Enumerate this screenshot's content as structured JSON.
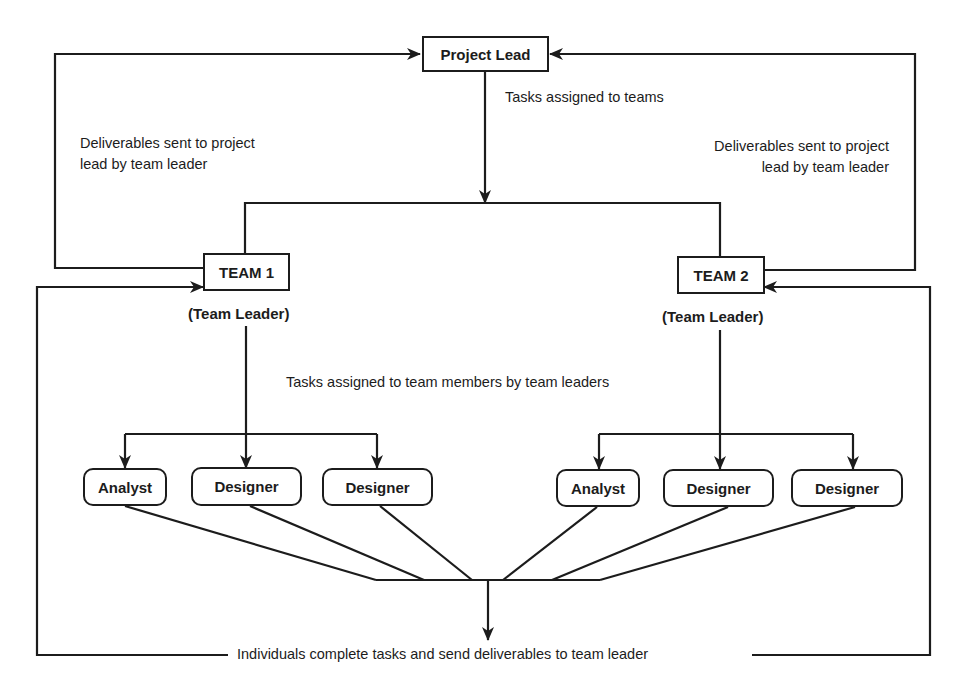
{
  "diagram": {
    "type": "team-hierarchy-flow",
    "line_color": "#1c1c1c",
    "nodes": {
      "project_lead": "Project Lead",
      "team1": "TEAM 1",
      "team1_role": "(Team Leader)",
      "team2": "TEAM 2",
      "team2_role": "(Team Leader)",
      "team1_members": [
        "Analyst",
        "Designer",
        "Designer"
      ],
      "team2_members": [
        "Analyst",
        "Designer",
        "Designer"
      ]
    },
    "labels": {
      "tasks_to_teams": "Tasks assigned to teams",
      "deliverables_left_line1": "Deliverables sent to project",
      "deliverables_left_line2": "lead by team leader",
      "deliverables_right_line1": "Deliverables sent to project",
      "deliverables_right_line2": "lead by team leader",
      "tasks_to_members": "Tasks assigned to team members by team leaders",
      "individuals_complete": "Individuals complete tasks and send deliverables to team leader"
    },
    "edges": [
      {
        "from": "Project Lead",
        "to": "TEAM 1",
        "label": "Tasks assigned to teams"
      },
      {
        "from": "Project Lead",
        "to": "TEAM 2",
        "label": "Tasks assigned to teams"
      },
      {
        "from": "TEAM 1",
        "to": "Project Lead",
        "label": "Deliverables sent to project lead by team leader"
      },
      {
        "from": "TEAM 2",
        "to": "Project Lead",
        "label": "Deliverables sent to project lead by team leader"
      },
      {
        "from": "TEAM 1",
        "to": "Analyst / Designer / Designer",
        "label": "Tasks assigned to team members by team leaders"
      },
      {
        "from": "TEAM 2",
        "to": "Analyst / Designer / Designer",
        "label": "Tasks assigned to team members by team leaders"
      },
      {
        "from": "All members",
        "to": "TEAM 1 & TEAM 2",
        "label": "Individuals complete tasks and send deliverables to team leader"
      }
    ]
  }
}
